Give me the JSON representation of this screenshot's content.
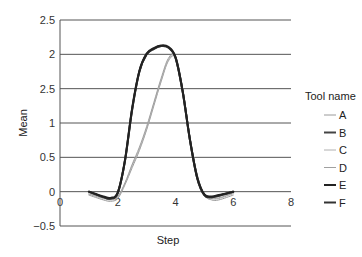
{
  "chart_data": {
    "type": "line",
    "title": "",
    "xlabel": "Step",
    "ylabel": "Mean",
    "xlim": [
      0,
      8
    ],
    "ylim": [
      -0.5,
      2.5
    ],
    "x_ticks": [
      "0",
      "2",
      "4",
      "6",
      "8"
    ],
    "y_ticks": [
      "2.5",
      "2",
      "2.5",
      "1",
      "0.5",
      "0",
      "-0.5"
    ],
    "grid": "horizontal",
    "legend": {
      "title": "Tool name",
      "position": "right",
      "entries": [
        {
          "name": "A",
          "color": "#9a9a9a"
        },
        {
          "name": "B",
          "color": "#444444"
        },
        {
          "name": "C",
          "color": "#b0b0b0"
        },
        {
          "name": "D",
          "color": "#a0a0a0"
        },
        {
          "name": "E",
          "color": "#222222"
        },
        {
          "name": "F",
          "color": "#333333"
        }
      ]
    },
    "x": [
      1,
      1.5,
      1.75,
      2,
      2.25,
      2.5,
      2.75,
      3,
      3.25,
      3.5,
      3.75,
      4,
      4.25,
      4.5,
      4.75,
      5,
      5.25,
      5.5,
      6
    ],
    "series": [
      {
        "name": "A",
        "values": [
          -0.05,
          -0.12,
          -0.14,
          -0.1,
          0.1,
          0.35,
          0.6,
          0.9,
          1.25,
          1.6,
          1.9,
          1.95,
          1.5,
          0.8,
          0.25,
          -0.05,
          -0.12,
          -0.12,
          -0.05
        ]
      },
      {
        "name": "B",
        "values": [
          0.0,
          -0.08,
          -0.1,
          -0.02,
          0.45,
          1.2,
          1.75,
          2.0,
          2.08,
          2.12,
          2.1,
          1.95,
          1.45,
          0.75,
          0.2,
          -0.05,
          -0.08,
          -0.06,
          0.0
        ]
      },
      {
        "name": "C",
        "values": [
          -0.04,
          -0.1,
          -0.12,
          -0.08,
          0.12,
          0.38,
          0.62,
          0.92,
          1.28,
          1.62,
          1.92,
          1.97,
          1.5,
          0.8,
          0.25,
          -0.04,
          -0.1,
          -0.1,
          -0.03
        ]
      },
      {
        "name": "D",
        "values": [
          -0.03,
          -0.09,
          -0.11,
          -0.07,
          0.13,
          0.4,
          0.65,
          0.95,
          1.3,
          1.65,
          1.94,
          1.98,
          1.5,
          0.8,
          0.25,
          -0.03,
          -0.09,
          -0.09,
          -0.02
        ]
      },
      {
        "name": "E",
        "values": [
          0.0,
          -0.07,
          -0.09,
          -0.01,
          0.46,
          1.22,
          1.76,
          2.01,
          2.09,
          2.13,
          2.11,
          1.96,
          1.46,
          0.76,
          0.21,
          -0.04,
          -0.07,
          -0.05,
          0.0
        ]
      },
      {
        "name": "F",
        "values": [
          0.0,
          -0.08,
          -0.1,
          -0.02,
          0.45,
          1.2,
          1.75,
          2.0,
          2.08,
          2.12,
          2.1,
          1.95,
          1.45,
          0.75,
          0.2,
          -0.05,
          -0.08,
          -0.06,
          0.0
        ]
      }
    ]
  }
}
